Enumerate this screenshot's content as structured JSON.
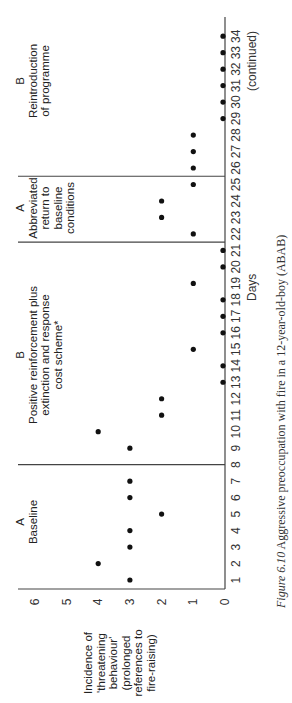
{
  "chart_data": {
    "type": "scatter",
    "title": "Aggressive preoccupation with fire in a 12-year-old-boy (ABAB)",
    "figure_label": "Figure 6.10",
    "xlabel": "Days",
    "ylabel": "Incidence of 'threatening behaviour' (prolonged references to fire-raising)",
    "ylim": [
      0,
      6
    ],
    "yticks": [
      0,
      1,
      2,
      3,
      4,
      5,
      6
    ],
    "xlim": [
      1,
      34
    ],
    "xticks": [
      1,
      2,
      3,
      4,
      5,
      6,
      7,
      8,
      9,
      10,
      11,
      12,
      13,
      14,
      15,
      16,
      17,
      18,
      19,
      20,
      21,
      22,
      23,
      24,
      25,
      26,
      27,
      28,
      29,
      30,
      31,
      32,
      33,
      34
    ],
    "grid": false,
    "legend": null,
    "note": "(continued)",
    "phases": [
      {
        "code": "A",
        "name": "Baseline",
        "start_day": 1,
        "end_day": 7
      },
      {
        "code": "B",
        "name": "Positive reinforcement plus extinction and response cost scheme*",
        "start_day": 9,
        "end_day": 21
      },
      {
        "code": "A",
        "name": "Abbreviated return to baseline conditions",
        "start_day": 22,
        "end_day": 25
      },
      {
        "code": "B",
        "name": "Reintroduction of programme",
        "start_day": 26,
        "end_day": 34
      }
    ],
    "phase_dividers_at_day": [
      8,
      21.5,
      25.5
    ],
    "x": [
      1,
      2,
      3,
      4,
      5,
      6,
      7,
      9,
      10,
      11,
      12,
      13,
      14,
      15,
      16,
      17,
      18,
      19,
      20,
      21,
      22,
      23,
      24,
      25,
      26,
      27,
      28,
      29,
      30,
      31,
      32,
      33,
      34
    ],
    "values": [
      3,
      4,
      3,
      3,
      2,
      3,
      3,
      3,
      4,
      2,
      2,
      0,
      0,
      1,
      0,
      0,
      0,
      1,
      0,
      0,
      1,
      2,
      2,
      1,
      1,
      1,
      1,
      0,
      0,
      0,
      0,
      0,
      0
    ]
  },
  "labels": {
    "phase1_code": "A",
    "phase1_name": "Baseline",
    "phase2_code": "B",
    "phase2_line1": "Positive reinforcement plus",
    "phase2_line2": "extinction and response",
    "phase2_line3": "cost scheme*",
    "phase3_code": "A",
    "phase3_line1": "Abbreviated",
    "phase3_line2": "return to",
    "phase3_line3": "baseline",
    "phase3_line4": "conditions",
    "phase4_code": "B",
    "phase4_line1": "Reintroduction",
    "phase4_line2": "of programme",
    "ylabel_line1": "Incidence of",
    "ylabel_line2": "'threatening",
    "ylabel_line3": "behaviour'",
    "ylabel_line4": "(prolonged",
    "ylabel_line5": "references to",
    "ylabel_line6": "fire-raising)",
    "xlabel": "Days",
    "continued": "(continued)",
    "caption_fig": "Figure 6.10",
    "caption_text": "Aggressive preoccupation with fire in a 12-year-old-boy (ABAB)"
  }
}
